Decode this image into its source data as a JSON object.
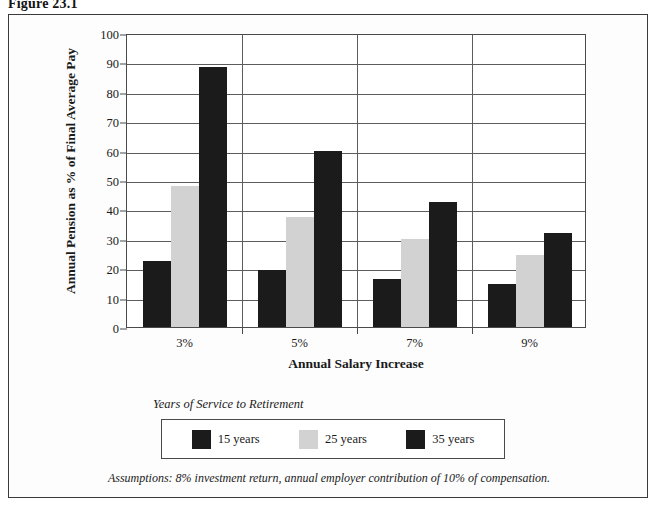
{
  "figure": {
    "caption": "Figure 23.1"
  },
  "legend": {
    "heading": "Years of Service to Retirement"
  },
  "footnote": {
    "text": "Assumptions: 8% investment return, annual employer contribution of 10% of compensation."
  },
  "colors": {
    "series_15_years": "#1b1b1b",
    "series_25_years": "#d2d2d2",
    "series_35_years": "#1b1b1b",
    "frame": "#3a3a3a",
    "gridline": "#5c5c5c",
    "background": "#fdfdfd"
  },
  "chart_data": {
    "type": "bar",
    "title": "Figure 23.1",
    "xlabel": "Annual Salary Increase",
    "ylabel": "Annual Pension as % of Final Average Pay",
    "categories": [
      "3%",
      "5%",
      "7%",
      "9%"
    ],
    "series": [
      {
        "name": "15 years",
        "values": [
          22.5,
          19.5,
          16.5,
          14.5
        ],
        "color": "#1b1b1b"
      },
      {
        "name": "25 years",
        "values": [
          48.0,
          37.5,
          30.0,
          24.5
        ],
        "color": "#d2d2d2"
      },
      {
        "name": "35 years",
        "values": [
          88.5,
          60.0,
          42.5,
          32.0
        ],
        "color": "#1b1b1b"
      }
    ],
    "ylim": [
      0,
      100
    ],
    "yticks": [
      0,
      10,
      20,
      30,
      40,
      50,
      60,
      70,
      80,
      90,
      100
    ],
    "ytick_labels": [
      "0",
      "10",
      "20",
      "30",
      "40",
      "50",
      "60",
      "70",
      "80",
      "90",
      "100"
    ],
    "grid": "horizontal-and-category-separators",
    "legend_position": "below-plot",
    "annotations": [
      "Years of Service to Retirement",
      "Assumptions: 8% investment return, annual employer contribution of 10% of compensation."
    ]
  }
}
